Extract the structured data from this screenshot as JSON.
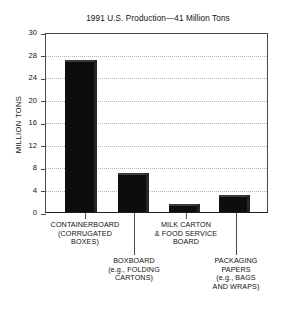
{
  "chart_data": {
    "type": "bar",
    "title": "1991 U.S. Production—41 Million Tons",
    "xlabel": "",
    "ylabel": "MILLION TONS",
    "ylim": [
      0,
      30
    ],
    "grid": true,
    "legend": "none",
    "yticks": [
      {
        "value": 0,
        "label": "0"
      },
      {
        "value": 4,
        "label": "4"
      },
      {
        "value": 8,
        "label": "8"
      },
      {
        "value": 12,
        "label": "12"
      },
      {
        "value": 16,
        "label": "16"
      },
      {
        "value": 20,
        "label": "20"
      },
      {
        "value": 24,
        "label": "24"
      },
      {
        "value": 28,
        "label": "28"
      },
      {
        "value": 30,
        "label": "30"
      }
    ],
    "categories": [
      "CONTAINERBOARD (CORRUGATED BOXES)",
      "BOXBOARD (e.g., FOLDING CARTONS)",
      "MILK CARTON & FOOD SERVICE BOARD",
      "PACKAGING PAPERS (e.g., BAGS AND WRAPS)"
    ],
    "values": [
      27,
      7,
      1.5,
      3
    ],
    "bars": [
      {
        "name": "containerboard",
        "value": 27,
        "label_lines": [
          "CONTAINERBOARD",
          "(CORRUGATED",
          "BOXES)"
        ],
        "label_row": "upper"
      },
      {
        "name": "boxboard",
        "value": 7,
        "label_lines": [
          "BOXBOARD",
          "(e.g., FOLDING",
          "CARTONS)"
        ],
        "label_row": "lower"
      },
      {
        "name": "milk-carton-food-service-board",
        "value": 1.5,
        "label_lines": [
          "MILK CARTON",
          "& FOOD SERVICE",
          "BOARD"
        ],
        "label_row": "upper"
      },
      {
        "name": "packaging-papers",
        "value": 3,
        "label_lines": [
          "PACKAGING",
          "PAPERS",
          "(e.g., BAGS",
          "AND WRAPS)"
        ],
        "label_row": "lower"
      }
    ],
    "colors": {
      "bar": "#0d0d0d",
      "axis": "#4a4a4a",
      "grid": "#b4b4b4",
      "text": "#111111",
      "background": "#ffffff"
    }
  }
}
